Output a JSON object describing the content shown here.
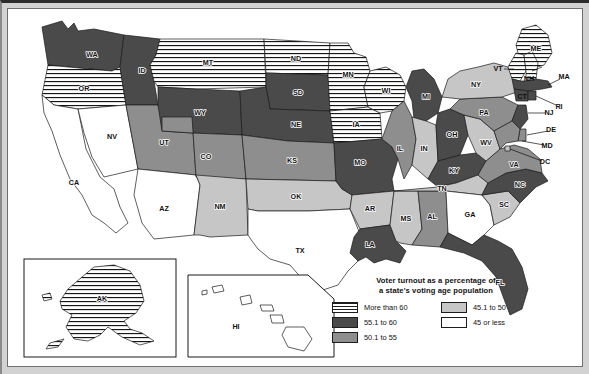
{
  "figure": {
    "kind": "choropleth-map",
    "region": "United States"
  },
  "legend": {
    "title_line1": "Voter turnout as a percentage of",
    "title_line2": "a state's voting age population",
    "items": [
      {
        "label": "More than 60",
        "swatch": "horizontal-stripes",
        "color": "#ffffff"
      },
      {
        "label": "45.1 to 50",
        "swatch": "solid",
        "color": "#c6c6c6"
      },
      {
        "label": "55.1 to 60",
        "swatch": "solid",
        "color": "#4a4a4a"
      },
      {
        "label": "45 or less",
        "swatch": "solid",
        "color": "#ffffff"
      },
      {
        "label": "50.1 to 55",
        "swatch": "solid",
        "color": "#8e8e8e"
      }
    ]
  },
  "insets": [
    {
      "name": "alaska-inset",
      "label": "AK",
      "category": "More than 60"
    },
    {
      "name": "hawaii-inset",
      "label": "HI",
      "category": "45 or less"
    }
  ],
  "states": {
    "WA": {
      "label": "WA",
      "category": "55.1 to 60"
    },
    "OR": {
      "label": "OR",
      "category": "More than 60"
    },
    "CA": {
      "label": "CA",
      "category": "45 or less"
    },
    "NV": {
      "label": "NV",
      "category": "45 or less"
    },
    "ID": {
      "label": "ID",
      "category": "55.1 to 60"
    },
    "MT": {
      "label": "MT",
      "category": "More than 60"
    },
    "WY": {
      "label": "WY",
      "category": "55.1 to 60"
    },
    "UT": {
      "label": "UT",
      "category": "50.1 to 55"
    },
    "AZ": {
      "label": "AZ",
      "category": "45 or less"
    },
    "NM": {
      "label": "NM",
      "category": "45.1 to 50"
    },
    "CO": {
      "label": "CO",
      "category": "50.1 to 55"
    },
    "ND": {
      "label": "ND",
      "category": "More than 60"
    },
    "SD": {
      "label": "SD",
      "category": "55.1 to 60"
    },
    "NE": {
      "label": "NE",
      "category": "55.1 to 60"
    },
    "KS": {
      "label": "KS",
      "category": "50.1 to 55"
    },
    "OK": {
      "label": "OK",
      "category": "45.1 to 50"
    },
    "TX": {
      "label": "TX",
      "category": "45 or less"
    },
    "MN": {
      "label": "MN",
      "category": "More than 60"
    },
    "IA": {
      "label": "IA",
      "category": "More than 60"
    },
    "MO": {
      "label": "MO",
      "category": "55.1 to 60"
    },
    "AR": {
      "label": "AR",
      "category": "45.1 to 50"
    },
    "LA": {
      "label": "LA",
      "category": "55.1 to 60"
    },
    "WI": {
      "label": "WI",
      "category": "More than 60"
    },
    "IL": {
      "label": "IL",
      "category": "50.1 to 55"
    },
    "MS": {
      "label": "MS",
      "category": "45.1 to 50"
    },
    "AL": {
      "label": "AL",
      "category": "50.1 to 55"
    },
    "MI": {
      "label": "MI",
      "category": "55.1 to 60"
    },
    "IN": {
      "label": "IN",
      "category": "45.1 to 50"
    },
    "KY": {
      "label": "KY",
      "category": "55.1 to 60"
    },
    "TN": {
      "label": "TN",
      "category": "45.1 to 50"
    },
    "GA": {
      "label": "GA",
      "category": "45 or less"
    },
    "FL": {
      "label": "FL",
      "category": "55.1 to 60"
    },
    "OH": {
      "label": "OH",
      "category": "55.1 to 60"
    },
    "WV": {
      "label": "WV",
      "category": "45.1 to 50"
    },
    "VA": {
      "label": "VA",
      "category": "50.1 to 55"
    },
    "NC": {
      "label": "NC",
      "category": "55.1 to 60"
    },
    "SC": {
      "label": "SC",
      "category": "45.1 to 50"
    },
    "PA": {
      "label": "PA",
      "category": "50.1 to 55"
    },
    "NY": {
      "label": "NY",
      "category": "45.1 to 50"
    },
    "ME": {
      "label": "ME",
      "category": "More than 60"
    },
    "VT": {
      "label": "VT",
      "category": "More than 60"
    },
    "NH": {
      "label": "NH",
      "category": "More than 60"
    },
    "MA": {
      "label": "MA",
      "category": "55.1 to 60"
    },
    "RI": {
      "label": "RI",
      "category": "55.1 to 60"
    },
    "CT": {
      "label": "CT",
      "category": "55.1 to 60"
    },
    "NJ": {
      "label": "NJ",
      "category": "55.1 to 60"
    },
    "DE": {
      "label": "DE",
      "category": "50.1 to 55"
    },
    "MD": {
      "label": "MD",
      "category": "50.1 to 55"
    },
    "DC": {
      "label": "DC",
      "category": "45.1 to 50"
    }
  }
}
